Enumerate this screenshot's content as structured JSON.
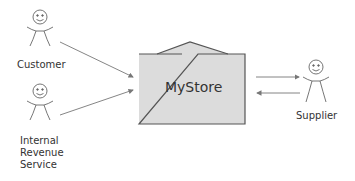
{
  "diagram": {
    "type": "context-diagram",
    "system": {
      "label": "MyStore",
      "fill": "#dcdcdc",
      "stroke": "#555555"
    },
    "actors": [
      {
        "id": "customer",
        "label": "Customer"
      },
      {
        "id": "irs",
        "label_lines": [
          "Internal",
          "Revenue",
          "Service"
        ]
      },
      {
        "id": "supplier",
        "label": "Supplier"
      }
    ],
    "flows": [
      {
        "from": "Customer",
        "to": "MyStore"
      },
      {
        "from": "Internal Revenue Service",
        "to": "MyStore"
      },
      {
        "from": "MyStore",
        "to": "Supplier"
      },
      {
        "from": "Supplier",
        "to": "MyStore"
      }
    ],
    "line_color": "#777777"
  }
}
